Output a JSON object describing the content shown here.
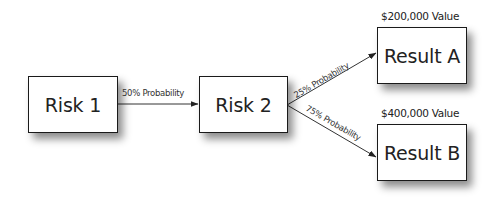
{
  "diagram": {
    "type": "decision-tree",
    "nodes": [
      {
        "id": "risk1",
        "label": "Risk 1"
      },
      {
        "id": "risk2",
        "label": "Risk 2"
      },
      {
        "id": "resultA",
        "label": "Result A",
        "value_label": "$200,000 Value"
      },
      {
        "id": "resultB",
        "label": "Result B",
        "value_label": "$400,000 Value"
      }
    ],
    "edges": [
      {
        "from": "risk1",
        "to": "risk2",
        "label": "50% Probability"
      },
      {
        "from": "risk2",
        "to": "resultA",
        "label": "25% Probability"
      },
      {
        "from": "risk2",
        "to": "resultB",
        "label": "75% Probability"
      }
    ]
  }
}
